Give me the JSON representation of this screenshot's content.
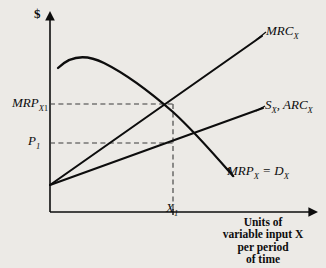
{
  "diagram": {
    "type": "economics-factor-market-graph",
    "background_color": "#eceae6",
    "ink_color": "#0d0d0d",
    "axes": {
      "y_axis_label": "$",
      "y_axis_label_name": "dollar-sign",
      "x_axis_caption_lines": [
        "Units of",
        "variable input X",
        "per period",
        "of time"
      ],
      "x_axis_caption": "Units of variable input X per period of time",
      "origin_px": [
        50,
        212
      ],
      "y_top_px": 15,
      "x_right_px": 318
    },
    "axis_value_labels": {
      "mrp_x1": {
        "text": "MRP",
        "sub": "X",
        "subsub": "1",
        "full": "MRPX1",
        "y_px": 104
      },
      "p1": {
        "text": "P",
        "sub": "1",
        "full": "P1",
        "y_px": 143
      },
      "x1": {
        "text": "X",
        "sub": "1",
        "full": "X1",
        "x_px": 173
      }
    },
    "curves": [
      {
        "id": "mrc-curve",
        "label_text": "MRC",
        "label_sub": "X",
        "label_full": "MRCX",
        "kind": "line",
        "description": "Marginal resource cost of X, upward sloping steep line from origin-intercept",
        "start_px": [
          50,
          185
        ],
        "end_px": [
          262,
          36
        ]
      },
      {
        "id": "supply-arc-curve",
        "label_text": "S",
        "label_sub": "X",
        "label_sep": ", ARC",
        "label_sub2": "X",
        "label_full": "SX, ARCX",
        "kind": "line",
        "description": "Supply of X, equals average resource cost, upward sloping flatter line",
        "start_px": [
          50,
          185
        ],
        "end_px": [
          262,
          109
        ]
      },
      {
        "id": "mrp-curve",
        "label_text": "MRP",
        "label_sub": "X",
        "label_eq": " = D",
        "label_sub2": "X",
        "label_full": "MRPX = DX",
        "kind": "concave-curve",
        "description": "Marginal revenue product of X equals demand for X; rises to a peak then falls",
        "start_px": [
          58,
          68
        ],
        "peak_px": [
          95,
          58
        ],
        "end_px": [
          233,
          176
        ]
      }
    ],
    "guide_lines": [
      {
        "id": "mrp-x1-guide",
        "orientation": "horizontal",
        "style": "dashed",
        "from_px": [
          50,
          104
        ],
        "to_px": [
          173,
          104
        ]
      },
      {
        "id": "p1-guide",
        "orientation": "horizontal",
        "style": "dashed",
        "from_px": [
          50,
          143
        ],
        "to_px": [
          173,
          143
        ]
      },
      {
        "id": "x1-guide",
        "orientation": "vertical",
        "style": "dashed",
        "from_px": [
          173,
          104
        ],
        "to_px": [
          173,
          212
        ]
      }
    ],
    "intersection_px": [
      173,
      104
    ]
  }
}
